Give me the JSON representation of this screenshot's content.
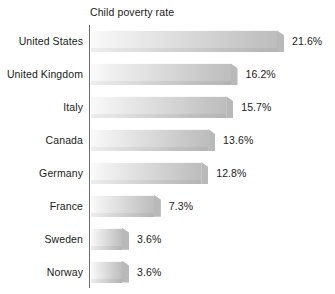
{
  "chart_data": {
    "type": "bar",
    "orientation": "horizontal",
    "title": "Child poverty rate",
    "xlabel": "",
    "ylabel": "",
    "grid": false,
    "legend": null,
    "axis": {
      "x_min": 0,
      "x_max": 21.6,
      "units": "percent"
    },
    "categories": [
      "United States",
      "United Kingdom",
      "Italy",
      "Canada",
      "Germany",
      "France",
      "Sweden",
      "Norway"
    ],
    "values": [
      21.6,
      16.2,
      15.7,
      13.6,
      12.8,
      7.3,
      3.6,
      3.6
    ],
    "value_labels": [
      "21.6%",
      "16.2%",
      "15.7%",
      "13.6%",
      "12.8%",
      "7.3%",
      "3.6%",
      "3.6%"
    ],
    "bars": [
      {
        "category": "United States",
        "value": 21.6,
        "label": "21.6%"
      },
      {
        "category": "United Kingdom",
        "value": 16.2,
        "label": "16.2%"
      },
      {
        "category": "Italy",
        "value": 15.7,
        "label": "15.7%"
      },
      {
        "category": "Canada",
        "value": 13.6,
        "label": "13.6%"
      },
      {
        "category": "Germany",
        "value": 12.8,
        "label": "12.8%"
      },
      {
        "category": "France",
        "value": 7.3,
        "label": "7.3%"
      },
      {
        "category": "Sweden",
        "value": 3.6,
        "label": "3.6%"
      },
      {
        "category": "Norway",
        "value": 3.6,
        "label": "3.6%"
      }
    ],
    "colors": {
      "background": "#ffffff",
      "text": "#1a1a1a",
      "axis_line": "#6d6d6d",
      "bar_gradient_start": "#fafafa",
      "bar_gradient_end": "#bdbdbd",
      "bar_shadow": "#b4b4b4"
    }
  }
}
